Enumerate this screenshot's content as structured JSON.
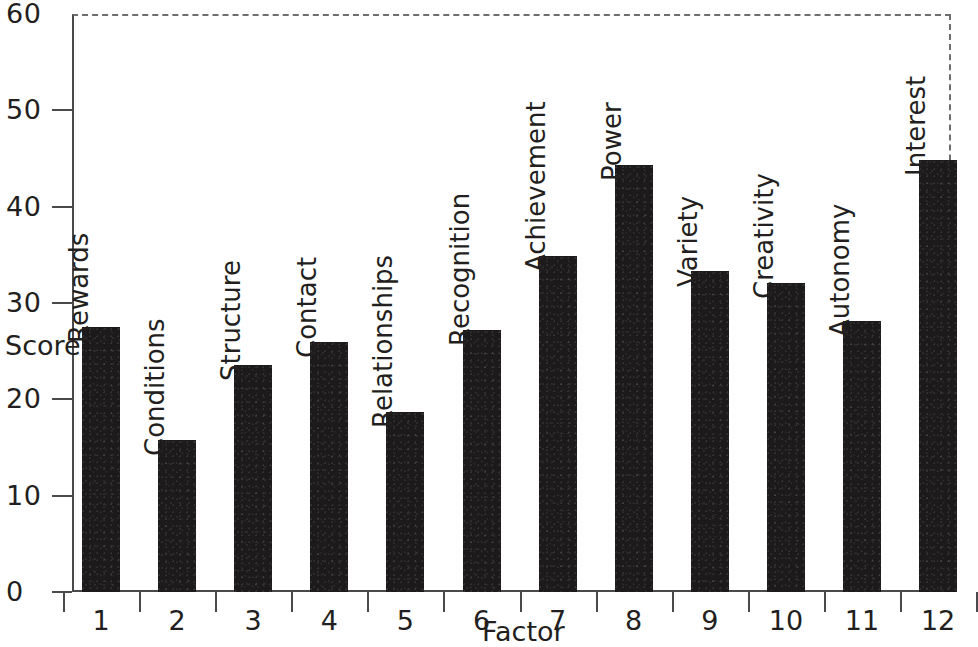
{
  "chart_data": {
    "type": "bar",
    "title": "",
    "xlabel": "Factor",
    "ylabel": "Score",
    "ylim": [
      0,
      60
    ],
    "yticks": [
      0,
      10,
      20,
      30,
      40,
      50,
      60
    ],
    "ytick_labels": [
      "0",
      "10",
      "20",
      "30",
      "40",
      "50",
      "60"
    ],
    "categories": [
      "1",
      "2",
      "3",
      "4",
      "5",
      "6",
      "7",
      "8",
      "9",
      "10",
      "11",
      "12"
    ],
    "bar_labels": [
      "Rewards",
      "Conditions",
      "Structure",
      "Contact",
      "Relationships",
      "Recognition",
      "Achievement",
      "Power",
      "Variety",
      "Creativity",
      "Autonomy",
      "Interest"
    ],
    "values": [
      27.5,
      15.8,
      23.6,
      25.9,
      18.7,
      27.2,
      34.9,
      44.3,
      33.3,
      32.1,
      28.1,
      44.8
    ],
    "grid": false,
    "legend": null,
    "bar_color": "#1c1a1b",
    "axis_color": "#4a4a4c",
    "frame_dashed_color": "#6e6e70",
    "text_color": "#231f20"
  }
}
